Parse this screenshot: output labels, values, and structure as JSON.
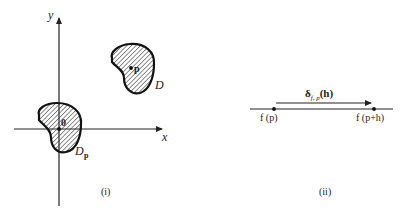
{
  "panel_i": {
    "caption": "(i)",
    "axis_x_label": "x",
    "axis_y_label": "y",
    "region_D_label": "D",
    "region_Dp_label_main": "D",
    "region_Dp_label_sub": "p",
    "point_p_label": "p",
    "origin_label": "0"
  },
  "panel_ii": {
    "caption": "(ii)",
    "arrow_label_main": "δ",
    "arrow_label_sub": "f, p",
    "arrow_label_arg": "(h)",
    "left_point_label": "f (p)",
    "right_point_label": "f (p+h)"
  },
  "colors": {
    "ink": "#222222",
    "background": "#ffffff"
  }
}
